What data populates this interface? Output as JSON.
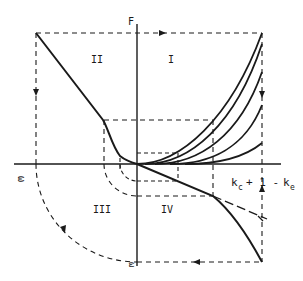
{
  "diagram": {
    "type": "four-quadrant construction diagram",
    "axes": {
      "vertical_label": "F",
      "horizontal_label": "k_c + 1 - k_e",
      "horizontal_label_parts": {
        "k1": "k",
        "sub1": "c",
        "mid": "+ 1 -",
        "k2": "k",
        "sub2": "e"
      },
      "left_label": "ω",
      "bottom_label": "ω"
    },
    "quadrants": [
      {
        "id": "I",
        "label": "I"
      },
      {
        "id": "II",
        "label": "II"
      },
      {
        "id": "III",
        "label": "III"
      },
      {
        "id": "IV",
        "label": "IV"
      }
    ],
    "quadrant_I_curve_count": 5,
    "line_color": "#1a1a1a",
    "background": "#ffffff"
  }
}
